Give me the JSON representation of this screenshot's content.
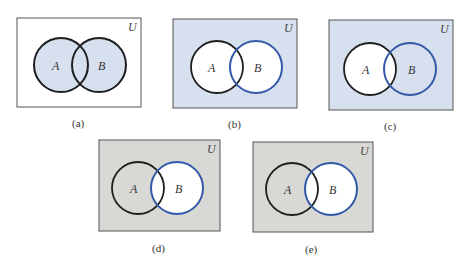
{
  "colors": {
    "blue_fill": "#d6e0ee",
    "gray_fill": "#d8d8d5",
    "white": "#ffffff",
    "black_stroke": "#1e1e1e",
    "blue_stroke": "#3358a8",
    "frame": "#555555"
  },
  "universe_label": "U",
  "set_a_label": "A",
  "set_b_label": "B",
  "diagrams": [
    {
      "caption": "(a)",
      "shading": "A ∪ B shaded blue",
      "x": 17,
      "y": 18,
      "w": 124,
      "h": 89,
      "a": {
        "cx": 61,
        "cy": 65,
        "r": 27
      },
      "b": {
        "cx": 99,
        "cy": 65,
        "r": 27
      },
      "caption_y": 127,
      "caption_x": 79
    },
    {
      "caption": "(b)",
      "shading": "complement of A ∪ B shaded blue",
      "x": 173,
      "y": 19,
      "w": 124,
      "h": 89,
      "a": {
        "cx": 217,
        "cy": 67,
        "r": 26
      },
      "b": {
        "cx": 256,
        "cy": 67,
        "r": 26
      },
      "caption_y": 127,
      "caption_x": 236
    },
    {
      "caption": "(c)",
      "shading": "complement of A shaded blue",
      "x": 329,
      "y": 20,
      "w": 124,
      "h": 90,
      "a": {
        "cx": 370,
        "cy": 69,
        "r": 26
      },
      "b": {
        "cx": 410,
        "cy": 69,
        "r": 26
      },
      "caption_y": 129,
      "caption_x": 390
    },
    {
      "caption": "(d)",
      "shading": "complement of B shaded gray",
      "x": 99,
      "y": 140,
      "w": 121,
      "h": 91,
      "a": {
        "cx": 138,
        "cy": 188,
        "r": 26
      },
      "b": {
        "cx": 177,
        "cy": 188,
        "r": 26
      },
      "caption_y": 251,
      "caption_x": 159
    },
    {
      "caption": "(e)",
      "shading": "complement of B shaded gray",
      "x": 253,
      "y": 142,
      "w": 120,
      "h": 90,
      "a": {
        "cx": 292,
        "cy": 189,
        "r": 26
      },
      "b": {
        "cx": 331,
        "cy": 189,
        "r": 26
      },
      "caption_y": 252,
      "caption_x": 311
    }
  ]
}
